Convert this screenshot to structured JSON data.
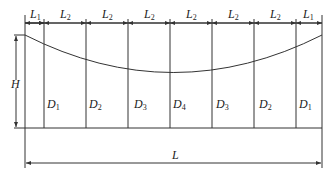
{
  "diagram": {
    "top_dimensions": [
      {
        "label": "L",
        "sub": "1"
      },
      {
        "label": "L",
        "sub": "2"
      },
      {
        "label": "L",
        "sub": "2"
      },
      {
        "label": "L",
        "sub": "2"
      },
      {
        "label": "L",
        "sub": "2"
      },
      {
        "label": "L",
        "sub": "2"
      },
      {
        "label": "L",
        "sub": "2"
      },
      {
        "label": "L",
        "sub": "1"
      }
    ],
    "height_label": "H",
    "length_label": "L",
    "columns": [
      {
        "label": "D",
        "sub": "1"
      },
      {
        "label": "D",
        "sub": "2"
      },
      {
        "label": "D",
        "sub": "3"
      },
      {
        "label": "D",
        "sub": "4"
      },
      {
        "label": "D",
        "sub": "3"
      },
      {
        "label": "D",
        "sub": "2"
      },
      {
        "label": "D",
        "sub": "1"
      }
    ],
    "colors": {
      "line": "#333333",
      "text": "#222222",
      "background": "#ffffff"
    }
  }
}
